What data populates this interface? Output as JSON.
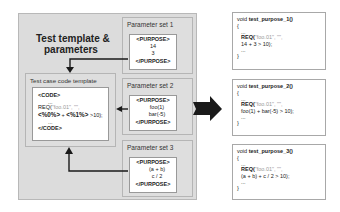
{
  "diagram": {
    "title_line1": "Test template &",
    "title_line2": "parameters",
    "template": {
      "title": "Test case code template",
      "open_tag": "<CODE>",
      "ellipsis": "...",
      "req_prefix": "REQ(",
      "req_args": "\"foo.01\", \"\",",
      "expr_a": "<%0%>",
      "expr_plus": " + ",
      "expr_b": "<%1%>",
      "expr_tail": " >10);",
      "close_tag": "</CODE>"
    },
    "parameter_sets": [
      {
        "title": "Parameter set 1",
        "open_tag": "<PURPOSE>",
        "values": [
          "14",
          "3"
        ],
        "close_tag": "</PURPOSE>"
      },
      {
        "title": "Parameter set 2",
        "open_tag": "<PURPOSE>",
        "values": [
          "foo(1)",
          "bar(-5)"
        ],
        "close_tag": "</PURPOSE>"
      },
      {
        "title": "Parameter set 3",
        "open_tag": "<PURPOSE>",
        "values": [
          "(a + b)",
          "c / 2"
        ],
        "close_tag": "</PURPOSE>"
      }
    ],
    "generated": [
      {
        "sig_void": "void ",
        "sig_name": "test_purpose_1()",
        "open": "{",
        "ellipsis": "...",
        "req": "REQ(",
        "req_args": "\"foo.01\", \"\",",
        "expr": "14 + 3 > 10);",
        "close": "}"
      },
      {
        "sig_void": "void ",
        "sig_name": "test_purpose_2()",
        "open": "{",
        "ellipsis": "...",
        "req": "REQ(",
        "req_args": "\"foo.01\", \"\",",
        "expr": "foo(1) + bar(-5) > 10);",
        "close": "}"
      },
      {
        "sig_void": "void ",
        "sig_name": "test_purpose_3()",
        "open": "{",
        "ellipsis": "...",
        "req": "REQ(",
        "req_args": "\"foo.01\", \"\",",
        "expr": "(a + b) + c / 2 > 10);",
        "close": "}"
      }
    ],
    "colors": {
      "panel": "#dcdcdc",
      "border": "#b5b5b5",
      "arrow": "#1a1a1a",
      "muted_text": "#999999"
    }
  }
}
